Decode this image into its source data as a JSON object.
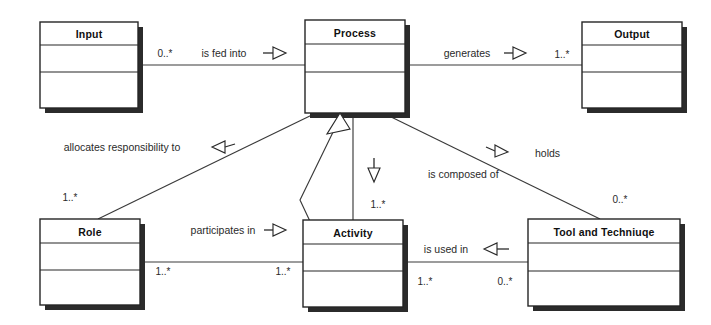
{
  "diagram": {
    "kind": "uml-class-diagram",
    "background_color": "#ffffff",
    "line_color": "#3a3a3a",
    "box_fill": "#ffffff",
    "box_stroke": "#262626",
    "shadow_color": "#2b2b2b"
  },
  "classes": [
    {
      "id": "input",
      "name": "Input",
      "x": 40,
      "y": 22,
      "w": 98,
      "h": 86
    },
    {
      "id": "process",
      "name": "Process",
      "x": 305,
      "y": 20,
      "w": 100,
      "h": 93
    },
    {
      "id": "output",
      "name": "Output",
      "x": 582,
      "y": 22,
      "w": 100,
      "h": 86
    },
    {
      "id": "role",
      "name": "Role",
      "x": 40,
      "y": 219,
      "w": 100,
      "h": 86
    },
    {
      "id": "activity",
      "name": "Activity",
      "x": 303,
      "y": 220,
      "w": 100,
      "h": 87
    },
    {
      "id": "tool",
      "name": "Tool and Techniuqe",
      "x": 528,
      "y": 219,
      "w": 152,
      "h": 87
    }
  ],
  "associations": [
    {
      "id": "input-process",
      "label": "is fed into",
      "arrow_direction": "right",
      "source": "input",
      "target": "process",
      "source_multiplicity": "0..*",
      "target_multiplicity": ""
    },
    {
      "id": "process-output",
      "label": "generates",
      "arrow_direction": "right",
      "source": "process",
      "target": "output",
      "source_multiplicity": "",
      "target_multiplicity": "1..*"
    },
    {
      "id": "process-role",
      "label": "allocates responsibility to",
      "arrow_direction": "left",
      "source": "process",
      "target": "role",
      "source_multiplicity": "",
      "target_multiplicity": "1..*"
    },
    {
      "id": "process-activity",
      "label": "is composed of",
      "arrow_direction": "down",
      "source": "process",
      "target": "activity",
      "source_multiplicity": "",
      "target_multiplicity": "1..*"
    },
    {
      "id": "process-tool",
      "label": "holds",
      "arrow_direction": "right",
      "source": "process",
      "target": "tool",
      "source_multiplicity": "",
      "target_multiplicity": "0..*"
    },
    {
      "id": "role-activity",
      "label": "participates in",
      "arrow_direction": "right",
      "source": "role",
      "target": "activity",
      "source_multiplicity": "1..*",
      "target_multiplicity": "1..*"
    },
    {
      "id": "activity-tool",
      "label": "is used in",
      "arrow_direction": "left",
      "source": "activity",
      "target": "tool",
      "source_multiplicity": "1..*",
      "target_multiplicity": "0..*"
    }
  ],
  "labels": {
    "input_title": "Input",
    "process_title": "Process",
    "output_title": "Output",
    "role_title": "Role",
    "activity_title": "Activity",
    "tool_title": "Tool and Techniuqe",
    "is_fed_into": "is fed into",
    "generates": "generates",
    "allocates_responsibility_to": "allocates responsibility to",
    "is_composed_of": "is composed of",
    "holds": "holds",
    "participates_in": "participates in",
    "is_used_in": "is used in"
  },
  "multiplicities": {
    "input_to_process": "0..*",
    "process_to_output": "1..*",
    "role_to_process": "1..*",
    "activity_to_process": "1..*",
    "tool_to_process": "0..*",
    "role_to_activity_left": "1..*",
    "role_to_activity_right": "1..*",
    "activity_to_tool_left": "1..*",
    "activity_to_tool_right": "0..*"
  }
}
